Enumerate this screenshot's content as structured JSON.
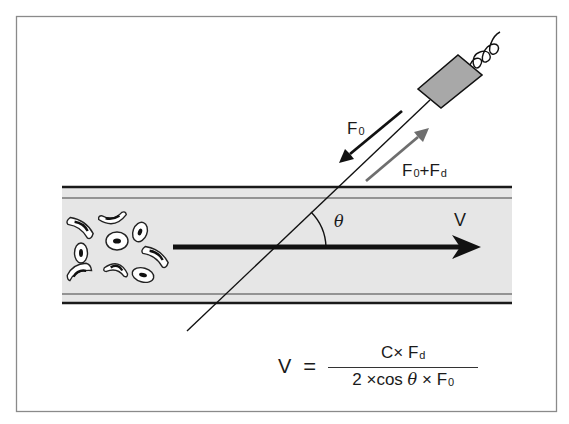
{
  "diagram": {
    "labels": {
      "f0_label": {
        "main": "F",
        "sub": "0"
      },
      "f0fd_label": {
        "main1": "F",
        "sub1": "0",
        "plus": "+",
        "main2": "F",
        "sub2": "d"
      },
      "theta_label": "θ",
      "velocity_label": "V"
    },
    "formula": {
      "lhs": "V",
      "equals": "=",
      "numerator": {
        "c": "C",
        "times": "×",
        "f": "F",
        "sub": "d"
      },
      "denominator": {
        "two": "2",
        "times1": "×",
        "cos": "cos",
        "theta": "θ",
        "times2": "×",
        "f": "F",
        "sub": "0"
      }
    },
    "components": [
      "frame",
      "blood-vessel",
      "red-blood-cells",
      "flow-velocity-arrow",
      "ultrasound-probe",
      "probe-beam-line",
      "transmitted-wave-arrow",
      "reflected-wave-arrow",
      "angle-arc"
    ],
    "colors": {
      "frame": "#888888",
      "vessel_fill": "#e6e6e6",
      "vessel_wall": "#1a1a1a",
      "vessel_inner_wall": "#777777",
      "probe_fill": "#a8a8a8",
      "reflected_arrow": "#6e6e6e",
      "ink": "#111111"
    }
  }
}
